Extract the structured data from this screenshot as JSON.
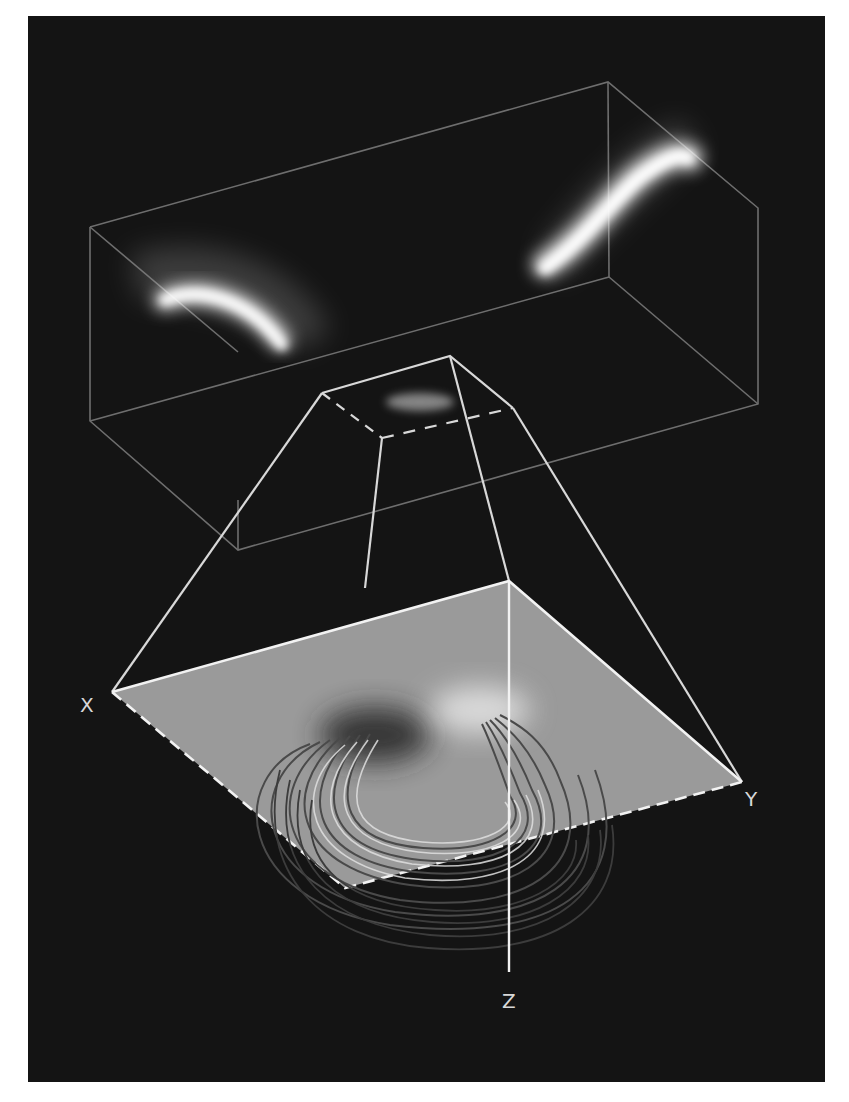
{
  "figure": {
    "colors": {
      "background": "#141414",
      "page": "#ffffff",
      "box_edges": "#6e6e6e",
      "frustum_lines": "#d0d0d0",
      "plane_fill": "#9a9a9a",
      "plane_edge": "#f0f0f0",
      "contour_dark": "#4a4a4a",
      "contour_light": "#e0e0e0",
      "glow": "#ffffff"
    },
    "axes": {
      "x_label": "X",
      "y_label": "Y",
      "z_label": "Z"
    }
  }
}
